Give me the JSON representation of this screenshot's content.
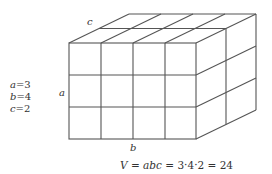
{
  "diagram": {
    "dimensions": {
      "a": 3,
      "b": 4,
      "c": 2
    },
    "edge_labels": {
      "a": "a",
      "b": "b",
      "c": "c"
    },
    "values": [
      {
        "var": "a",
        "eq": "=",
        "val": "3"
      },
      {
        "var": "b",
        "eq": "=",
        "val": "4"
      },
      {
        "var": "c",
        "eq": "=",
        "val": "2"
      }
    ],
    "formula": {
      "lhs": "V",
      "eq1": " = ",
      "product": "abc",
      "eq2": " = ",
      "expansion": "3·4·2",
      "eq3": " = ",
      "result": "24"
    },
    "colors": {
      "line": "#555555",
      "text": "#333333",
      "background": "#ffffff"
    }
  }
}
